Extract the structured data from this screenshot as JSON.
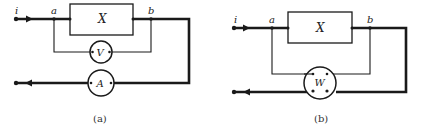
{
  "figure": {
    "panels": [
      {
        "id": "a",
        "caption": "(a)",
        "labels": {
          "current": "i",
          "node_a": "a",
          "node_b": "b",
          "element": "X",
          "voltmeter": "V",
          "ammeter": "A"
        },
        "description": "Element X between nodes a and b; voltmeter V connected across a-b; ammeter A in series on return line"
      },
      {
        "id": "b",
        "caption": "(b)",
        "labels": {
          "current": "i",
          "node_a": "a",
          "node_b": "b",
          "element": "X",
          "wattmeter": "W"
        },
        "description": "Element X between nodes a and b; wattmeter W voltage coil across a-b and current coil in series on return line"
      }
    ],
    "colors": {
      "ink": "#1a1a1a",
      "background": "#ffffff"
    }
  }
}
